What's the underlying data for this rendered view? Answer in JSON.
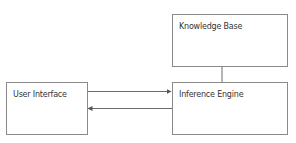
{
  "diagram": {
    "nodes": [
      {
        "id": "knowledge_base",
        "label": "Knowledge Base"
      },
      {
        "id": "user_interface",
        "label": "User Interface"
      },
      {
        "id": "inference_engine",
        "label": "Inference Engine"
      }
    ],
    "edges": [
      {
        "from": "user_interface",
        "to": "inference_engine",
        "type": "arrow"
      },
      {
        "from": "inference_engine",
        "to": "user_interface",
        "type": "arrow"
      },
      {
        "from": "knowledge_base",
        "to": "inference_engine",
        "type": "line"
      }
    ],
    "colors": {
      "border": "#8a8a8a",
      "line": "#6b6b6b",
      "text": "#333333",
      "background": "#ffffff"
    }
  }
}
